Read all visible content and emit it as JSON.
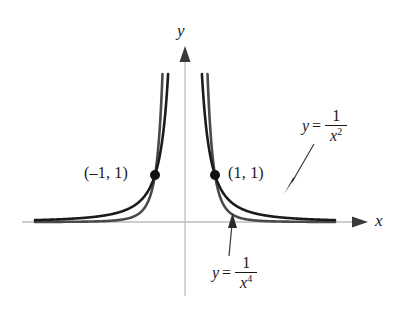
{
  "chart_data": {
    "type": "line",
    "title": "",
    "xlabel": "x",
    "ylabel": "y",
    "grid": false,
    "legend_position": "inline-annotation",
    "axes": {
      "origin_label": "",
      "x_axis_label": "x",
      "y_axis_label": "y",
      "xlim": [
        -5.0,
        5.0
      ],
      "ylim": [
        0,
        3.2
      ],
      "show_ticks": false,
      "show_grid": false
    },
    "series": [
      {
        "name": "y = 1/x^2",
        "expression": "1/x^2",
        "exponent": 2,
        "color": "#1b1b1b",
        "label_text": "y =",
        "numerator": "1",
        "denominator_base": "x",
        "denominator_exponent": "2",
        "points_x": [
          -5.0,
          -4.0,
          -3.0,
          -2.5,
          -2.0,
          -1.6,
          -1.3,
          -1.0,
          -0.85,
          -0.7,
          -0.6,
          -0.55,
          0.55,
          0.6,
          0.7,
          0.85,
          1.0,
          1.3,
          1.6,
          2.0,
          2.5,
          3.0,
          4.0,
          5.0
        ],
        "points_y": [
          0.04,
          0.0625,
          0.111,
          0.16,
          0.25,
          0.391,
          0.592,
          1.0,
          1.384,
          2.041,
          2.778,
          3.306,
          3.306,
          2.778,
          2.041,
          1.384,
          1.0,
          0.592,
          0.391,
          0.25,
          0.16,
          0.111,
          0.0625,
          0.04
        ]
      },
      {
        "name": "y = 1/x^4",
        "expression": "1/x^4",
        "exponent": 4,
        "color": "#4a4a4a",
        "label_text": "y =",
        "numerator": "1",
        "denominator_base": "x",
        "denominator_exponent": "4",
        "points_x": [
          -5.0,
          -4.0,
          -3.0,
          -2.5,
          -2.0,
          -1.6,
          -1.3,
          -1.0,
          -0.9,
          -0.8,
          -0.75,
          -0.72,
          0.72,
          0.75,
          0.8,
          0.9,
          1.0,
          1.3,
          1.6,
          2.0,
          2.5,
          3.0,
          4.0,
          5.0
        ],
        "points_y": [
          0.0016,
          0.0039,
          0.0123,
          0.0256,
          0.0625,
          0.1526,
          0.3501,
          1.0,
          1.524,
          2.441,
          3.16,
          3.72,
          3.72,
          3.16,
          2.441,
          1.524,
          1.0,
          0.3501,
          0.1526,
          0.0625,
          0.0256,
          0.0123,
          0.0039,
          0.0016
        ]
      }
    ],
    "marked_points": [
      {
        "label": "(–1, 1)",
        "x": -1,
        "y": 1
      },
      {
        "label": "(1, 1)",
        "x": 1,
        "y": 1
      }
    ],
    "annotations": [
      {
        "target_series": "y = 1/x^2",
        "label": "y = 1/x²",
        "direction": "down-left"
      },
      {
        "target_series": "y = 1/x^4",
        "label": "y = 1/x⁴",
        "direction": "up-left"
      }
    ]
  },
  "figure": {
    "axis_label_y": "y",
    "axis_label_x": "x",
    "point_label_left": "(–1, 1)",
    "point_label_right": "(1, 1)",
    "eq1": {
      "lhs": "y",
      "equals": "=",
      "numerator": "1",
      "den_base": "x",
      "den_exp": "2"
    },
    "eq2": {
      "lhs": "y",
      "equals": "=",
      "numerator": "1",
      "den_base": "x",
      "den_exp": "4"
    },
    "colors": {
      "curve_x2": "#1b1b1b",
      "curve_x4": "#4a4a4a",
      "axis": "#b8b8b8",
      "text": "#1a1a1a",
      "background": "#ffffff"
    }
  }
}
